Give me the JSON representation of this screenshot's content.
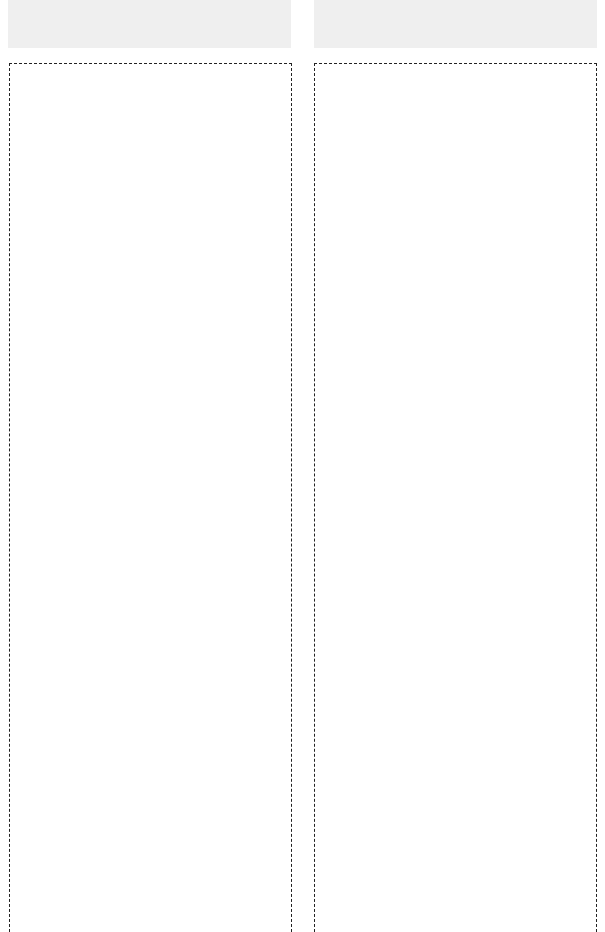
{
  "layout": {
    "columns": [
      {
        "id": "left",
        "header_panel": "",
        "content_box": ""
      },
      {
        "id": "right",
        "header_panel": "",
        "content_box": ""
      }
    ]
  },
  "colors": {
    "panel_bg": "#efefef",
    "border": "#222222",
    "background": "#ffffff"
  }
}
